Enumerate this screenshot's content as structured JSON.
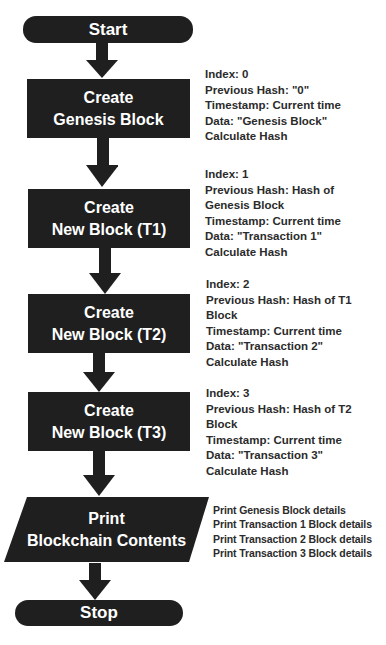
{
  "diagram": {
    "type": "flowchart",
    "colors": {
      "node_fill": "#1f1f1f",
      "node_text": "#ffffff",
      "annotation_text": "#2b2b2b",
      "background": "#ffffff"
    },
    "nodes": {
      "start": {
        "shape": "terminator",
        "label": "Start"
      },
      "genesis": {
        "shape": "process",
        "line1": "Create",
        "line2": "Genesis Block"
      },
      "t1": {
        "shape": "process",
        "line1": "Create",
        "line2": "New Block (T1)"
      },
      "t2": {
        "shape": "process",
        "line1": "Create",
        "line2": "New Block (T2)"
      },
      "t3": {
        "shape": "process",
        "line1": "Create",
        "line2": "New Block (T3)"
      },
      "print": {
        "shape": "input-output",
        "line1": "Print",
        "line2": "Blockchain Contents"
      },
      "stop": {
        "shape": "terminator",
        "label": "Stop"
      }
    },
    "edges": [
      [
        "start",
        "genesis"
      ],
      [
        "genesis",
        "t1"
      ],
      [
        "t1",
        "t2"
      ],
      [
        "t2",
        "t3"
      ],
      [
        "t3",
        "print"
      ],
      [
        "print",
        "stop"
      ]
    ],
    "annotations": {
      "genesis": [
        "Index: 0",
        "Previous Hash: \"0\"",
        "Timestamp: Current time",
        "Data: \"Genesis Block\"",
        "Calculate Hash"
      ],
      "t1": [
        "Index: 1",
        "Previous Hash: Hash of",
        "Genesis Block",
        "Timestamp: Current time",
        "Data: \"Transaction 1\"",
        "Calculate Hash"
      ],
      "t2": [
        "Index: 2",
        "Previous Hash: Hash of T1",
        "Block",
        "Timestamp: Current time",
        "Data: \"Transaction 2\"",
        "Calculate Hash"
      ],
      "t3": [
        "Index: 3",
        "Previous Hash: Hash of T2",
        "Block",
        "Timestamp: Current time",
        "Data: \"Transaction 3\"",
        "Calculate Hash"
      ],
      "print": [
        "Print Genesis Block details",
        "Print Transaction 1 Block details",
        "Print Transaction 2 Block details",
        "Print Transaction 3 Block details"
      ]
    }
  }
}
